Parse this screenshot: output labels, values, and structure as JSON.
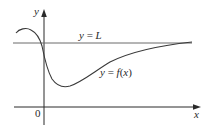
{
  "diagram": {
    "axes": {
      "x_label": "x",
      "y_label": "y",
      "origin_label": "0"
    },
    "asymptote": {
      "label_y": "y",
      "label_eq": " = ",
      "label_val": "L"
    },
    "curve": {
      "label_y": "y",
      "label_eq": " = ",
      "label_f": "f",
      "label_open": "(",
      "label_x": "x",
      "label_close": ")"
    },
    "colors": {
      "axis": "#2a2a2a",
      "curve": "#3a3a3a",
      "asymptote": "#6a6a6a",
      "background": "#ffffff"
    }
  }
}
